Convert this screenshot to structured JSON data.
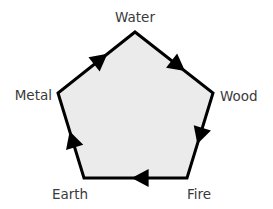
{
  "diagram": {
    "fill_color": "#ebebeb",
    "stroke_color": "#000000",
    "label_color": "#3a3a3a",
    "nodes": [
      {
        "id": "water",
        "label": "Water"
      },
      {
        "id": "wood",
        "label": "Wood"
      },
      {
        "id": "fire",
        "label": "Fire"
      },
      {
        "id": "earth",
        "label": "Earth"
      },
      {
        "id": "metal",
        "label": "Metal"
      }
    ],
    "edges": [
      {
        "from": "water",
        "to": "wood"
      },
      {
        "from": "wood",
        "to": "fire"
      },
      {
        "from": "fire",
        "to": "earth"
      },
      {
        "from": "earth",
        "to": "metal"
      },
      {
        "from": "metal",
        "to": "water"
      }
    ],
    "direction": "clockwise"
  }
}
